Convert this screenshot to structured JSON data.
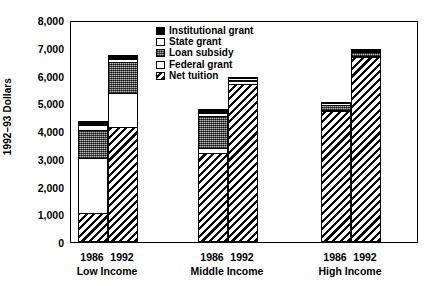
{
  "chart_data": {
    "type": "bar",
    "title": "",
    "xlabel": "",
    "ylabel": "1992–93 Dollars",
    "ylim": [
      0,
      8000
    ],
    "ytick_labels": [
      "8,000",
      "7,000",
      "6,000",
      "5,000",
      "4,000",
      "3,000",
      "2,000",
      "1,000",
      "0"
    ],
    "ytick_values": [
      8000,
      7000,
      6000,
      5000,
      4000,
      3000,
      2000,
      1000,
      0
    ],
    "grid": false,
    "legend_position": "top-center",
    "stacked": true,
    "groups": [
      "Low Income",
      "Middle Income",
      "High Income"
    ],
    "years": [
      "1986",
      "1992"
    ],
    "categories": [
      "Low Income 1986",
      "Low Income 1992",
      "Middle Income 1986",
      "Middle Income 1992",
      "High Income 1986",
      "High Income 1992"
    ],
    "series": [
      {
        "name": "Net tuition",
        "pattern": "diagonal-hatch",
        "values": [
          1000,
          4100,
          3200,
          5700,
          4700,
          6650
        ]
      },
      {
        "name": "Federal grant",
        "pattern": "white",
        "values": [
          2000,
          1250,
          150,
          100,
          50,
          50
        ]
      },
      {
        "name": "Loan subsidy",
        "pattern": "stipple-gray",
        "values": [
          1050,
          1150,
          1200,
          50,
          200,
          150
        ]
      },
      {
        "name": "State grant",
        "pattern": "white",
        "values": [
          150,
          100,
          100,
          50,
          50,
          50
        ]
      },
      {
        "name": "Institutional grant",
        "pattern": "black",
        "values": [
          150,
          150,
          150,
          50,
          50,
          50
        ]
      }
    ],
    "totals": [
      4350,
      6750,
      4800,
      5950,
      5050,
      6950
    ],
    "legend": [
      {
        "label": "Institutional grant",
        "pattern": "black"
      },
      {
        "label": "State grant",
        "pattern": "white"
      },
      {
        "label": "Loan subsidy",
        "pattern": "stipple-gray"
      },
      {
        "label": "Federal grant",
        "pattern": "white"
      },
      {
        "label": "Net tuition",
        "pattern": "diagonal-hatch"
      }
    ]
  }
}
